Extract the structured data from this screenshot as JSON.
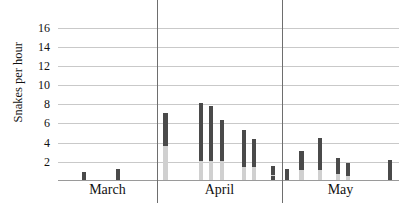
{
  "chart_data": {
    "type": "bar",
    "title": "",
    "xlabel": "",
    "ylabel": "Snakes per hour",
    "ylim": [
      0,
      17
    ],
    "yticks": [
      2,
      4,
      6,
      8,
      10,
      12,
      14,
      16
    ],
    "ytick_labels": [
      "2",
      "4",
      "6",
      "8",
      "10",
      "12",
      "14",
      "16"
    ],
    "grid": true,
    "legend": "none",
    "stacked": true,
    "series": [
      {
        "name": "lower-segment",
        "color": "#d0d0d0"
      },
      {
        "name": "upper-segment",
        "color": "#4a4a4a"
      }
    ],
    "group_labels": [
      "March",
      "April",
      "May"
    ],
    "group_separators": [
      29.0,
      65.7
    ],
    "bars": [
      {
        "x": 7.6,
        "low": 0.0,
        "high": 0.8
      },
      {
        "x": 17.6,
        "low": 0.0,
        "high": 1.2
      },
      {
        "x": 31.5,
        "low": 3.5,
        "high": 7.0
      },
      {
        "x": 41.9,
        "low": 2.0,
        "high": 8.0
      },
      {
        "x": 44.9,
        "low": 2.0,
        "high": 7.7
      },
      {
        "x": 48.0,
        "low": 2.0,
        "high": 6.3
      },
      {
        "x": 54.5,
        "low": 1.4,
        "high": 5.2
      },
      {
        "x": 57.5,
        "low": 1.4,
        "high": 4.3
      },
      {
        "x": 63.0,
        "low": 0.5,
        "high": 1.5
      },
      {
        "x": 63.0,
        "low": 0.0,
        "high": 0.4
      },
      {
        "x": 67.2,
        "low": 0.0,
        "high": 1.2
      },
      {
        "x": 71.4,
        "low": 1.0,
        "high": 3.0
      },
      {
        "x": 76.8,
        "low": 1.0,
        "high": 4.4
      },
      {
        "x": 82.0,
        "low": 0.6,
        "high": 2.3
      },
      {
        "x": 85.0,
        "low": 0.4,
        "high": 1.8
      },
      {
        "x": 97.3,
        "low": 0.0,
        "high": 2.1
      }
    ]
  }
}
